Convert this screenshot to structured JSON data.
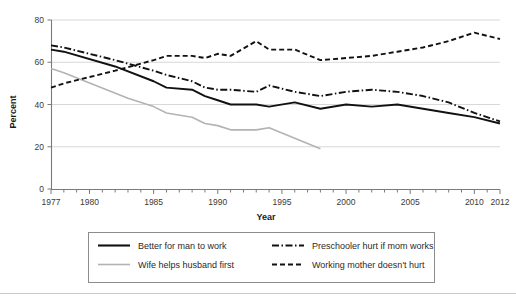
{
  "chart_data": {
    "type": "line",
    "title": "",
    "xlabel": "Year",
    "ylabel": "Percent",
    "xlim": [
      1977,
      2012
    ],
    "ylim": [
      0,
      80
    ],
    "yticks": [
      0,
      20,
      40,
      60,
      80
    ],
    "xticks_labeled": [
      1977,
      1980,
      1985,
      1990,
      1995,
      2000,
      2005,
      2010,
      2012
    ],
    "grid": "horizontal",
    "legend_position": "below-axes",
    "x": [
      1977,
      1978,
      1979,
      1980,
      1981,
      1982,
      1983,
      1984,
      1985,
      1986,
      1987,
      1988,
      1989,
      1990,
      1991,
      1992,
      1993,
      1994,
      1995,
      1996,
      1997,
      1998,
      1999,
      2000,
      2001,
      2002,
      2003,
      2004,
      2005,
      2006,
      2007,
      2008,
      2009,
      2010,
      2011,
      2012
    ],
    "series": [
      {
        "name": "Better for man to work",
        "style": "solid",
        "color": "#111111",
        "x": [
          1977,
          1978,
          1982,
          1985,
          1986,
          1988,
          1989,
          1990,
          1991,
          1993,
          1994,
          1996,
          1998,
          2000,
          2002,
          2004,
          2006,
          2008,
          2010,
          2012
        ],
        "values": [
          66,
          65,
          58,
          51,
          48,
          47,
          44,
          42,
          40,
          40,
          39,
          41,
          38,
          40,
          39,
          40,
          38,
          36,
          34,
          31
        ]
      },
      {
        "name": "Wife helps husband first",
        "style": "solid",
        "color": "#b3b3b3",
        "x": [
          1977,
          1978,
          1983,
          1985,
          1986,
          1988,
          1989,
          1990,
          1991,
          1993,
          1994,
          1996,
          1998
        ],
        "values": [
          57,
          55,
          43,
          39,
          36,
          34,
          31,
          30,
          28,
          28,
          29,
          24,
          19
        ]
      },
      {
        "name": "Preschooler hurt if mom works",
        "style": "dashdot",
        "color": "#111111",
        "x": [
          1977,
          1978,
          1982,
          1985,
          1986,
          1988,
          1989,
          1990,
          1991,
          1993,
          1994,
          1996,
          1998,
          2000,
          2002,
          2004,
          2006,
          2008,
          2010,
          2012
        ],
        "values": [
          68,
          67,
          61,
          56,
          54,
          51,
          48,
          47,
          47,
          46,
          49,
          46,
          44,
          46,
          47,
          46,
          44,
          41,
          36,
          32
        ]
      },
      {
        "name": "Working mother doesn't hurt",
        "style": "dashed",
        "color": "#111111",
        "x": [
          1977,
          1978,
          1982,
          1985,
          1986,
          1988,
          1989,
          1990,
          1991,
          1993,
          1994,
          1996,
          1998,
          2000,
          2002,
          2004,
          2006,
          2008,
          2010,
          2012
        ],
        "values": [
          48,
          50,
          56,
          61,
          63,
          63,
          62,
          64,
          63,
          70,
          66,
          66,
          61,
          62,
          63,
          65,
          67,
          70,
          74,
          71
        ]
      }
    ]
  },
  "axes": {
    "y_label": "Percent",
    "x_label": "Year",
    "y_tick_labels": [
      "0",
      "20",
      "40",
      "60",
      "80"
    ],
    "x_tick_labels": [
      "1977",
      "1980",
      "1985",
      "1990",
      "1995",
      "2000",
      "2005",
      "2010",
      "2012"
    ]
  },
  "legend": {
    "entries": [
      {
        "label": "Better for man to work",
        "style": "solid",
        "color": "#111111"
      },
      {
        "label": "Wife helps husband first",
        "style": "solid",
        "color": "#b3b3b3"
      },
      {
        "label": "Preschooler hurt if mom works",
        "style": "dashdot",
        "color": "#111111"
      },
      {
        "label": "Working mother doesn't hurt",
        "style": "dashed",
        "color": "#111111"
      }
    ]
  },
  "colors": {
    "primary": "#111111",
    "secondary": "#b3b3b3",
    "grid": "#d8d8d8",
    "axis": "#7a7a7a"
  }
}
